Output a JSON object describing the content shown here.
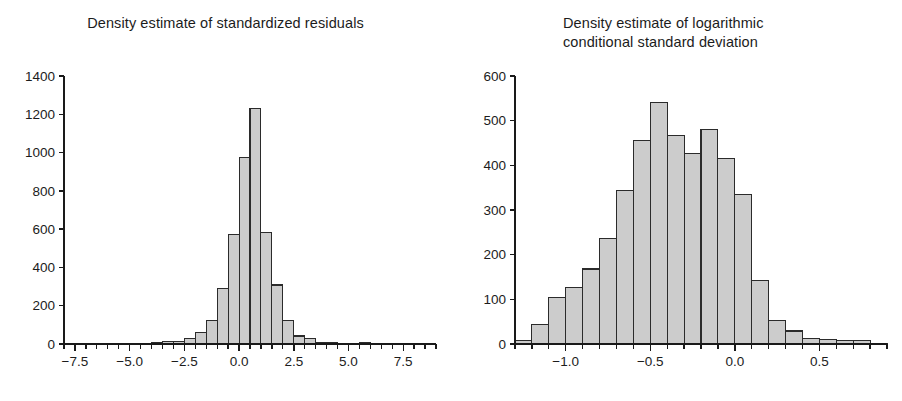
{
  "figure": {
    "background_color": "#ffffff",
    "bar_fill_color": "#cccccc",
    "bar_edge_color": "#2b2b2b",
    "axis_color": "#1a1a1a",
    "text_color": "#1c1c1c"
  },
  "panels": {
    "left": {
      "title": "Density estimate of standardized residuals"
    },
    "right": {
      "title": "Density estimate of logarithmic\nconditional standard deviation"
    }
  },
  "chart_data": [
    {
      "type": "bar",
      "id": "standardized-residuals-histogram",
      "title": "Density estimate of standardized residuals",
      "xlabel": "",
      "ylabel": "",
      "grid": false,
      "legend": null,
      "xlim": [
        -8.0,
        9.0
      ],
      "ylim": [
        0,
        1400
      ],
      "bin_width": 0.5,
      "xticks": [
        -7.5,
        -5.0,
        -2.5,
        0.0,
        2.5,
        5.0,
        7.5
      ],
      "xticklabels": [
        "-7.5",
        "-5.0",
        "-2.5",
        "0.0",
        "2.5",
        "5.0",
        "7.5"
      ],
      "xminorticks": [
        -8.0,
        -7.0,
        -6.5,
        -6.0,
        -5.5,
        -4.5,
        -4.0,
        -3.5,
        -3.0,
        -2.0,
        -1.5,
        -1.0,
        -0.5,
        0.5,
        1.0,
        1.5,
        2.0,
        3.0,
        3.5,
        4.0,
        4.5,
        5.5,
        6.0,
        6.5,
        7.0,
        8.0,
        8.5,
        9.0
      ],
      "yticks": [
        0,
        200,
        400,
        600,
        800,
        1000,
        1200,
        1400
      ],
      "yticklabels": [
        "0",
        "200",
        "400",
        "600",
        "800",
        "1000",
        "1200",
        "1400"
      ],
      "bin_edges": [
        -8.0,
        -7.5,
        -7.0,
        -6.5,
        -6.0,
        -5.5,
        -5.0,
        -4.5,
        -4.0,
        -3.5,
        -3.0,
        -2.5,
        -2.0,
        -1.5,
        -1.0,
        -0.5,
        0.0,
        0.5,
        1.0,
        1.5,
        2.0,
        2.5,
        3.0,
        3.5,
        4.0,
        4.5,
        5.0,
        5.5,
        6.0,
        6.5,
        7.0,
        7.5,
        8.0,
        8.5,
        9.0
      ],
      "categories": [
        "-8.0",
        "-7.5",
        "-7.0",
        "-6.5",
        "-6.0",
        "-5.5",
        "-5.0",
        "-4.5",
        "-4.0",
        "-3.5",
        "-3.0",
        "-2.5",
        "-2.0",
        "-1.5",
        "-1.0",
        "-0.5",
        "0.0",
        "0.5",
        "1.0",
        "1.5",
        "2.0",
        "2.5",
        "3.0",
        "3.5",
        "4.0",
        "4.5",
        "5.0",
        "5.5",
        "6.0",
        "6.5",
        "7.0",
        "7.5",
        "8.0",
        "8.5"
      ],
      "values": [
        0,
        0,
        0,
        0,
        0,
        0,
        0,
        0,
        5,
        12,
        14,
        30,
        62,
        125,
        288,
        573,
        972,
        1228,
        583,
        308,
        125,
        42,
        30,
        10,
        5,
        0,
        4,
        5,
        0,
        0,
        0,
        3,
        0,
        0
      ]
    },
    {
      "type": "bar",
      "id": "log-conditional-sd-histogram",
      "title": "Density estimate of logarithmic conditional standard deviation",
      "xlabel": "",
      "ylabel": "",
      "grid": false,
      "legend": null,
      "xlim": [
        -1.3,
        0.9
      ],
      "ylim": [
        0,
        600
      ],
      "bin_width": 0.1,
      "xticks": [
        -1.0,
        -0.5,
        0.0,
        0.5
      ],
      "xticklabels": [
        "-1.0",
        "-0.5",
        "0.0",
        "0.5"
      ],
      "xminorticks": [
        -1.3,
        -1.2,
        -1.1,
        -0.9,
        -0.8,
        -0.7,
        -0.6,
        -0.4,
        -0.3,
        -0.2,
        -0.1,
        0.1,
        0.2,
        0.3,
        0.4,
        0.6,
        0.7,
        0.8,
        0.9
      ],
      "yticks": [
        0,
        100,
        200,
        300,
        400,
        500,
        600
      ],
      "yticklabels": [
        "0",
        "100",
        "200",
        "300",
        "400",
        "500",
        "600"
      ],
      "bin_edges": [
        -1.3,
        -1.2,
        -1.1,
        -1.0,
        -0.9,
        -0.8,
        -0.7,
        -0.6,
        -0.5,
        -0.4,
        -0.3,
        -0.2,
        -0.1,
        0.0,
        0.1,
        0.2,
        0.3,
        0.4,
        0.5,
        0.6,
        0.7,
        0.8,
        0.9
      ],
      "categories": [
        "-1.3",
        "-1.2",
        "-1.1",
        "-1.0",
        "-0.9",
        "-0.8",
        "-0.7",
        "-0.6",
        "-0.5",
        "-0.4",
        "-0.3",
        "-0.2",
        "-0.1",
        "0.0",
        "0.1",
        "0.2",
        "0.3",
        "0.4",
        "0.5",
        "0.6",
        "0.7",
        "0.8"
      ],
      "values": [
        8,
        44,
        104,
        126,
        168,
        236,
        343,
        456,
        541,
        467,
        426,
        481,
        416,
        334,
        142,
        53,
        29,
        13,
        10,
        8,
        7,
        2
      ]
    }
  ]
}
